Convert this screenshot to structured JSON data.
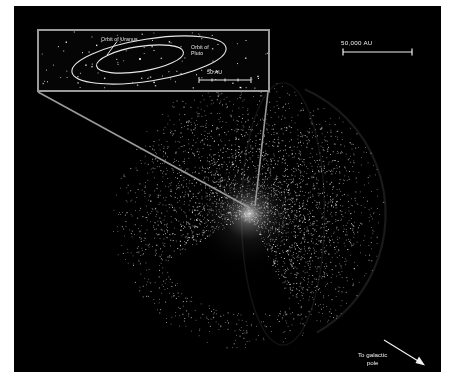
{
  "figure": {
    "background_color": "#000000",
    "page_background": "#ffffff",
    "star_color": "#ffffff",
    "rule_color": "#9a9a9a",
    "text_color": "#f0f0f0"
  },
  "inset": {
    "name": "inner-solar-system-inset",
    "border_color": "#9a9a9a",
    "labels": {
      "uranus": "Orbit of Uranus",
      "pluto": "Orbit of\nPluto"
    },
    "scale_bar": {
      "label": "50 AU",
      "ticks": 5
    },
    "orbits": [
      {
        "name": "uranus-orbit",
        "semi_major": 44,
        "semi_minor": 13
      },
      {
        "name": "pluto-orbit",
        "semi_major": 78,
        "semi_minor": 22
      }
    ]
  },
  "annotations": {
    "scale_bar_outer": {
      "label": "50,000 AU",
      "name": "scale-bar-50000-au"
    },
    "galactic_pole": {
      "label": "To galactic\npole",
      "name": "galactic-pole-annotation",
      "arrow_direction": "down-right"
    }
  },
  "chart_data": {
    "type": "scatter",
    "xlabel": "",
    "ylabel": "",
    "grid": false,
    "legend": null,
    "scales": [
      {
        "label": "50 AU",
        "context": "inset",
        "value": 50,
        "unit": "AU"
      },
      {
        "label": "50,000 AU",
        "context": "main",
        "value": 50000,
        "unit": "AU"
      }
    ],
    "annotations": [
      {
        "text": "Orbit of Uranus",
        "context": "inset"
      },
      {
        "text": "Orbit of Pluto",
        "context": "inset"
      },
      {
        "text": "To galactic pole",
        "context": "main"
      }
    ],
    "sphere": {
      "center_x": 249,
      "center_y": 214,
      "radius": 138,
      "point_count": 4200,
      "core_glow": true,
      "cutaway_wedge": true
    },
    "inset_points": 95
  }
}
